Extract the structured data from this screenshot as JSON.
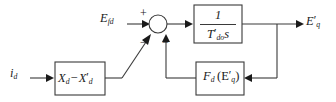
{
  "diagram": {
    "type": "control-block-diagram",
    "background_color": "#ffffff",
    "line_color": "#3a3a3a",
    "text_color": "#1a1a1a",
    "signals": {
      "input_field_voltage": "E",
      "input_field_voltage_sub": "fd",
      "input_current": "i",
      "input_current_sub": "d",
      "output": "E",
      "output_sub": "q",
      "output_prime": "′"
    },
    "summing_junction": {
      "name": "summing-junction",
      "sign_plus": "+",
      "sign_minus_left": "−",
      "sign_minus_right": "−"
    },
    "blocks": {
      "reactance_difference": {
        "main_1": "X",
        "sub_1": "d",
        "operator": "−",
        "main_2": "X",
        "prime_2": "′",
        "sub_2": "d"
      },
      "transfer_function": {
        "numerator": "1",
        "den_main": "T",
        "den_prime": "′",
        "den_sub": "do",
        "den_var": "s"
      },
      "saturation_feedback": {
        "func": "F",
        "func_sub": "d",
        "open_paren": "(",
        "arg": "E",
        "arg_prime": "′",
        "arg_sub": "q",
        "close_paren": ")"
      }
    }
  }
}
